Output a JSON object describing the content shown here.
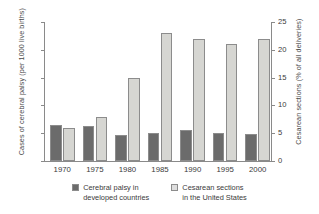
{
  "chart_data": {
    "type": "bar",
    "title": "",
    "xlabel": "",
    "grid": false,
    "legend_position": "bottom",
    "categories": [
      "1970",
      "1975",
      "1980",
      "1985",
      "1990",
      "1995",
      "2000"
    ],
    "axes": {
      "left": {
        "label": "Cases of cerebral palsy (per 1000 live births)",
        "ticks": [
          "0",
          "2",
          "4",
          "6",
          "8",
          "10"
        ],
        "tick_values": [
          0,
          2,
          4,
          6,
          8,
          10
        ],
        "ylim": [
          0,
          10
        ]
      },
      "right": {
        "label": "Cesarean sections (% of all deliveries)",
        "ticks": [
          "0",
          "5",
          "10",
          "15",
          "20",
          "25"
        ],
        "tick_values": [
          0,
          5,
          10,
          15,
          20,
          25
        ],
        "ylim": [
          0,
          25
        ]
      }
    },
    "series": [
      {
        "name": "Cerebral palsy in developed countries",
        "axis": "left",
        "color": "#6b6b6b",
        "values": [
          2.6,
          2.55,
          1.85,
          2.05,
          2.25,
          2.05,
          1.95
        ]
      },
      {
        "name": "Cesarean sections in the United States",
        "axis": "right",
        "color": "#d6d6d2",
        "values": [
          5.9,
          7.9,
          15.0,
          23.1,
          22.0,
          21.0,
          22.0
        ]
      }
    ]
  },
  "legend": {
    "items": [
      {
        "line1": "Cerebral palsy in",
        "line2": "developed countries",
        "swatch": "dark"
      },
      {
        "line1": "Cesarean sections",
        "line2": "in the United States",
        "swatch": "light"
      }
    ]
  }
}
